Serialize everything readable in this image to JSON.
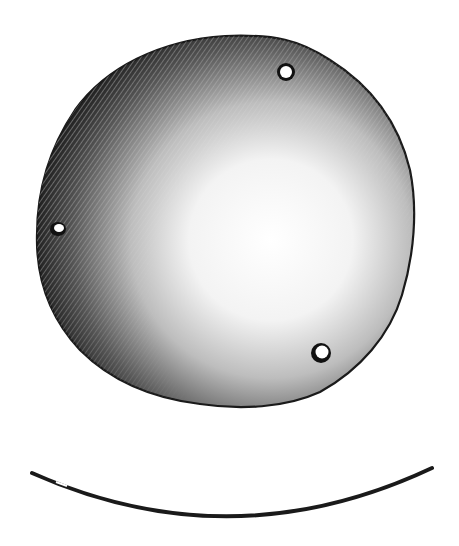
{
  "figure": {
    "background": "#ffffff",
    "ink": "#1a1a1a",
    "disc": {
      "cx": 225,
      "cy": 222,
      "rx": 188,
      "ry": 186
    },
    "holes": [
      {
        "name": "hole-top-right",
        "cx": 286,
        "cy": 72,
        "r": 7
      },
      {
        "name": "hole-left",
        "cx": 58,
        "cy": 229,
        "r": 6
      },
      {
        "name": "hole-bottom-right",
        "cx": 321,
        "cy": 353,
        "r": 7
      }
    ],
    "profile": {
      "x1": 32,
      "y1": 473,
      "x2": 432,
      "y2": 468,
      "ctrl_y": 562,
      "stroke": 4
    }
  }
}
